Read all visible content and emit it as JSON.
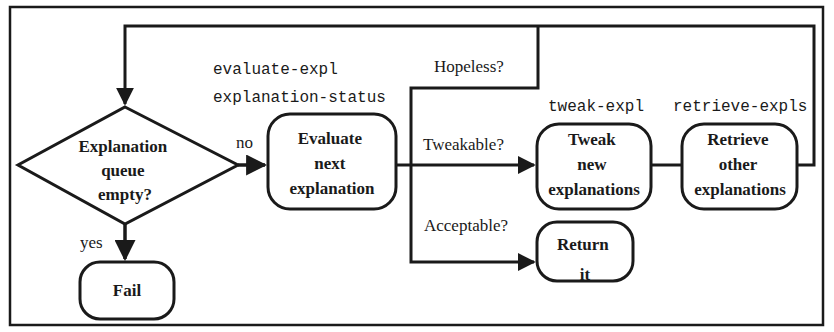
{
  "diagram": {
    "type": "flowchart",
    "colors": {
      "stroke": "#1a1a1a",
      "background": "#ffffff"
    },
    "nodes": {
      "decision": {
        "shape": "diamond",
        "lines": [
          "Explanation",
          "queue",
          "empty?"
        ]
      },
      "evaluate": {
        "shape": "rounded-rect",
        "lines": [
          "Evaluate",
          "next",
          "explanation"
        ],
        "function": [
          "evaluate-expl",
          "explanation-status"
        ]
      },
      "tweak": {
        "shape": "rounded-rect",
        "lines": [
          "Tweak",
          "new",
          "explanations"
        ],
        "function": "tweak-expl"
      },
      "retrieve": {
        "shape": "rounded-rect",
        "lines": [
          "Retrieve",
          "other",
          "explanations"
        ],
        "function": "retrieve-expls"
      },
      "return": {
        "shape": "rounded-rect",
        "lines": [
          "Return",
          "it"
        ]
      },
      "fail": {
        "shape": "rounded-rect",
        "lines": [
          "Fail"
        ]
      }
    },
    "edge_labels": {
      "no": "no",
      "yes": "yes",
      "hopeless": "Hopeless?",
      "tweakable": "Tweakable?",
      "acceptable": "Acceptable?"
    },
    "edges": [
      {
        "from": "decision",
        "to": "evaluate",
        "label": "no"
      },
      {
        "from": "decision",
        "to": "fail",
        "label": "yes"
      },
      {
        "from": "evaluate",
        "to": "decision",
        "label": "Hopeless?"
      },
      {
        "from": "evaluate",
        "to": "tweak",
        "label": "Tweakable?"
      },
      {
        "from": "evaluate",
        "to": "return",
        "label": "Acceptable?"
      },
      {
        "from": "tweak",
        "to": "retrieve",
        "label": ""
      },
      {
        "from": "retrieve",
        "to": "decision",
        "label": ""
      }
    ]
  }
}
